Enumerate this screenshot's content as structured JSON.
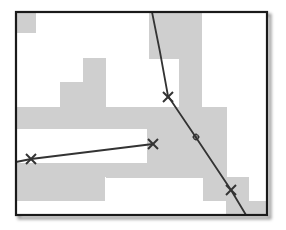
{
  "figure": {
    "frame": {
      "x": 16,
      "y": 12,
      "width": 251,
      "height": 203,
      "stroke": "#1a1a1a",
      "shadow": "#bdbdbd"
    },
    "background": "#ffffff",
    "fill_color": "#cfcfcf",
    "line_color": "#333333",
    "grid_cells": [
      {
        "x": 16,
        "y": 12,
        "w": 20,
        "h": 21
      },
      {
        "x": 149,
        "y": 12,
        "w": 53,
        "h": 47
      },
      {
        "x": 179,
        "y": 59,
        "w": 23,
        "h": 48
      },
      {
        "x": 83,
        "y": 58,
        "w": 23,
        "h": 24
      },
      {
        "x": 60,
        "y": 82,
        "w": 46,
        "h": 25
      },
      {
        "x": 16,
        "y": 107,
        "w": 211,
        "h": 22
      },
      {
        "x": 16,
        "y": 129,
        "w": 0,
        "h": 0
      },
      {
        "x": 147,
        "y": 129,
        "w": 80,
        "h": 48
      },
      {
        "x": 16,
        "y": 163,
        "w": 131,
        "h": 14
      },
      {
        "x": 16,
        "y": 177,
        "w": 89,
        "h": 24
      },
      {
        "x": 203,
        "y": 177,
        "w": 46,
        "h": 24
      },
      {
        "x": 226,
        "y": 201,
        "w": 41,
        "h": 14
      },
      {
        "x": 106,
        "y": 177,
        "w": 97,
        "h": 24
      }
    ],
    "white_cutouts": [
      {
        "x": 16,
        "y": 129,
        "w": 131,
        "h": 34
      },
      {
        "x": 106,
        "y": 178,
        "w": 97,
        "h": 23
      }
    ],
    "polylines": [
      {
        "name": "curved-path",
        "points": "152,12 160,52 168,96 195,136 231,190 246,215"
      },
      {
        "name": "straight-path",
        "points": "16,162 31,159 153,144"
      }
    ],
    "markers": [
      {
        "name": "waypoint-cross-1",
        "x": 31,
        "y": 159,
        "type": "x"
      },
      {
        "name": "waypoint-cross-2",
        "x": 153,
        "y": 144,
        "type": "x"
      },
      {
        "name": "waypoint-cross-3",
        "x": 168,
        "y": 97,
        "type": "x"
      },
      {
        "name": "waypoint-cross-4",
        "x": 231,
        "y": 190,
        "type": "x"
      },
      {
        "name": "center-target",
        "x": 196,
        "y": 137,
        "type": "target"
      }
    ]
  }
}
